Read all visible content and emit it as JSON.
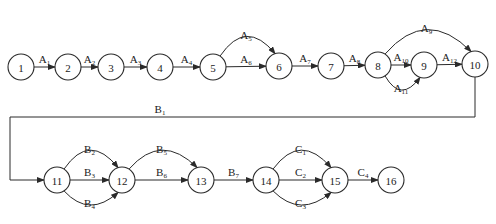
{
  "diagram": {
    "type": "activity-network",
    "nodes": [
      {
        "id": "1",
        "label": "1"
      },
      {
        "id": "2",
        "label": "2"
      },
      {
        "id": "3",
        "label": "3"
      },
      {
        "id": "4",
        "label": "4"
      },
      {
        "id": "5",
        "label": "5"
      },
      {
        "id": "6",
        "label": "6"
      },
      {
        "id": "7",
        "label": "7"
      },
      {
        "id": "8",
        "label": "8"
      },
      {
        "id": "9",
        "label": "9"
      },
      {
        "id": "10",
        "label": "10"
      },
      {
        "id": "11",
        "label": "11"
      },
      {
        "id": "12",
        "label": "12"
      },
      {
        "id": "13",
        "label": "13"
      },
      {
        "id": "14",
        "label": "14"
      },
      {
        "id": "15",
        "label": "15"
      },
      {
        "id": "16",
        "label": "16"
      }
    ],
    "edges": [
      {
        "from": "1",
        "to": "2",
        "letter": "A",
        "sub": "1"
      },
      {
        "from": "2",
        "to": "3",
        "letter": "A",
        "sub": "2"
      },
      {
        "from": "3",
        "to": "4",
        "letter": "A",
        "sub": "3"
      },
      {
        "from": "4",
        "to": "5",
        "letter": "A",
        "sub": "4"
      },
      {
        "from": "5",
        "to": "6",
        "letter": "A",
        "sub": "5"
      },
      {
        "from": "5",
        "to": "6",
        "letter": "A",
        "sub": "6"
      },
      {
        "from": "6",
        "to": "7",
        "letter": "A",
        "sub": "7"
      },
      {
        "from": "7",
        "to": "8",
        "letter": "A",
        "sub": "8"
      },
      {
        "from": "8",
        "to": "10",
        "letter": "A",
        "sub": "9"
      },
      {
        "from": "8",
        "to": "9",
        "letter": "A",
        "sub": "10"
      },
      {
        "from": "8",
        "to": "9",
        "letter": "A",
        "sub": "11"
      },
      {
        "from": "9",
        "to": "10",
        "letter": "A",
        "sub": "12"
      },
      {
        "from": "10",
        "to": "11",
        "letter": "B",
        "sub": "1"
      },
      {
        "from": "11",
        "to": "12",
        "letter": "B",
        "sub": "2"
      },
      {
        "from": "11",
        "to": "12",
        "letter": "B",
        "sub": "3"
      },
      {
        "from": "11",
        "to": "12",
        "letter": "B",
        "sub": "4"
      },
      {
        "from": "12",
        "to": "13",
        "letter": "B",
        "sub": "5"
      },
      {
        "from": "12",
        "to": "13",
        "letter": "B",
        "sub": "6"
      },
      {
        "from": "13",
        "to": "14",
        "letter": "B",
        "sub": "7"
      },
      {
        "from": "14",
        "to": "15",
        "letter": "C",
        "sub": "1"
      },
      {
        "from": "14",
        "to": "15",
        "letter": "C",
        "sub": "2"
      },
      {
        "from": "14",
        "to": "15",
        "letter": "C",
        "sub": "3"
      },
      {
        "from": "15",
        "to": "16",
        "letter": "C",
        "sub": "4"
      }
    ]
  }
}
